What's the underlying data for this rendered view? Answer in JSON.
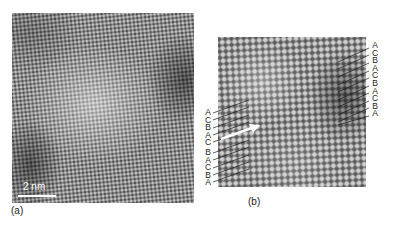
{
  "figure": {
    "panel_a": {
      "label": "(a)",
      "scale_bar": "2 nm"
    },
    "panel_b": {
      "label": "(b)",
      "stacking_right": [
        "A",
        "C",
        "B",
        "A",
        "C",
        "B",
        "A",
        "C",
        "B",
        "A"
      ],
      "stacking_left_top": [
        "A",
        "C",
        "B",
        "A",
        "C"
      ],
      "stacking_left_bottom": [
        "B",
        "A",
        "C",
        "B",
        "A"
      ]
    }
  }
}
